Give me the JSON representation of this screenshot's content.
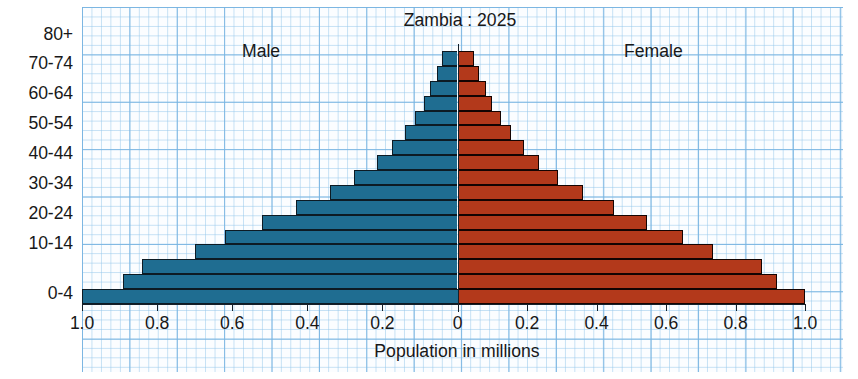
{
  "chart_data": {
    "type": "bar",
    "subtype": "population-pyramid",
    "title": "Zambia : 2025",
    "xlabel": "Population in millions",
    "ylabel": "",
    "xlim": [
      -1.0,
      1.0
    ],
    "grid": true,
    "legend_position": "inside-top",
    "axis_left_label": "Male",
    "axis_right_label": "Female",
    "x_ticks": [
      {
        "value": -1.0,
        "label": "1.0"
      },
      {
        "value": -0.8,
        "label": "0.8"
      },
      {
        "value": -0.6,
        "label": "0.6"
      },
      {
        "value": -0.4,
        "label": "0.4"
      },
      {
        "value": -0.2,
        "label": "0.2"
      },
      {
        "value": 0.0,
        "label": "0"
      },
      {
        "value": 0.2,
        "label": "0.2"
      },
      {
        "value": 0.4,
        "label": "0.4"
      },
      {
        "value": 0.6,
        "label": "0.6"
      },
      {
        "value": 0.8,
        "label": "0.8"
      },
      {
        "value": 1.0,
        "label": "1.0"
      }
    ],
    "y_tick_labels": [
      "80+",
      "70-74",
      "60-64",
      "50-54",
      "40-44",
      "30-34",
      "20-24",
      "10-14",
      "0-4"
    ],
    "categories": [
      "80+",
      "75-79",
      "70-74",
      "65-69",
      "60-64",
      "55-59",
      "50-54",
      "45-49",
      "40-44",
      "35-39",
      "30-34",
      "25-29",
      "20-24",
      "15-19",
      "10-14",
      "5-9",
      "0-4"
    ],
    "series": [
      {
        "name": "Male",
        "color": "#1f6d91",
        "values": [
          0.04,
          0.054,
          0.072,
          0.09,
          0.112,
          0.14,
          0.175,
          0.215,
          0.275,
          0.34,
          0.43,
          0.52,
          0.62,
          0.7,
          0.84,
          0.89,
          1.0
        ]
      },
      {
        "name": "Female",
        "color": "#b3391b",
        "values": [
          0.048,
          0.062,
          0.082,
          0.1,
          0.124,
          0.155,
          0.19,
          0.235,
          0.29,
          0.36,
          0.45,
          0.545,
          0.65,
          0.735,
          0.875,
          0.92,
          1.0
        ]
      }
    ]
  }
}
